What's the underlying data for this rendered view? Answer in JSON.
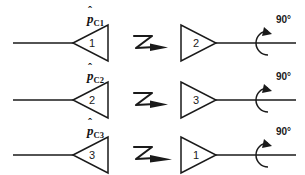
{
  "figure": {
    "title": "",
    "background_color": "#ffffff",
    "stroke_color": "#1a1a1a",
    "width": 305,
    "height": 175
  },
  "rows": [
    {
      "id": "row-1",
      "label": {
        "base": "p",
        "hat": "ˆ",
        "subscript": "C1"
      },
      "input_triangle_number": "1",
      "link_symbol": "zigzag-arrow",
      "output_triangle_number": "2",
      "rotation_label": "90°"
    },
    {
      "id": "row-2",
      "label": {
        "base": "p",
        "hat": "ˆ",
        "subscript": "C2"
      },
      "input_triangle_number": "2",
      "link_symbol": "zigzag-arrow",
      "output_triangle_number": "3",
      "rotation_label": "90°"
    },
    {
      "id": "row-3",
      "label": {
        "base": "p",
        "hat": "ˆ",
        "subscript": "C3"
      },
      "input_triangle_number": "3",
      "link_symbol": "zigzag-arrow",
      "output_triangle_number": "1",
      "rotation_label": "90°"
    }
  ],
  "icons": {
    "zigzag": "zigzag-arrow-icon",
    "rotation": "rotation-arc-icon",
    "input_triangle": "left-triangle-icon",
    "output_triangle": "right-triangle-icon"
  }
}
